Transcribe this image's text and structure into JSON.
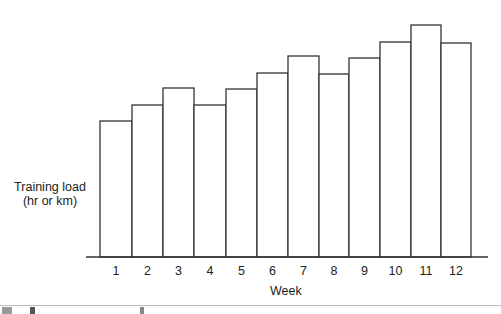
{
  "chart_data": {
    "type": "bar",
    "title": "",
    "xlabel": "Week",
    "ylabel": "Training load\n(hr or km)",
    "ylabel_lines": [
      "Training load",
      "(hr or km)"
    ],
    "categories": [
      "1",
      "2",
      "3",
      "4",
      "5",
      "6",
      "7",
      "8",
      "9",
      "10",
      "11",
      "12"
    ],
    "values": [
      136,
      152,
      169,
      152,
      168,
      184,
      201,
      183,
      199,
      215,
      232,
      214
    ],
    "value_units": "relative (no y-axis scale shown; pixel heights above baseline)",
    "ylim": [
      0,
      240
    ],
    "grid": false,
    "legend": null,
    "bar_style": {
      "fill": "#ffffff",
      "stroke": "#333333"
    },
    "y_ticks_shown": false
  },
  "layout": {
    "baseline_y": 257,
    "axis_x_start": 86,
    "axis_x_end": 488,
    "bar_edges": [
      100,
      132,
      163,
      194,
      226,
      257,
      288,
      319,
      349,
      380,
      411,
      441,
      471
    ]
  },
  "labels": {
    "ylabel_line1": "Training load",
    "ylabel_line2": "(hr or km)",
    "xlabel": "Week"
  }
}
